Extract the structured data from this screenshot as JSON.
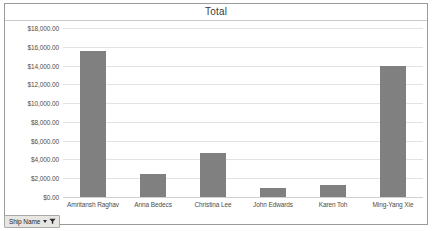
{
  "chart_data": {
    "type": "bar",
    "title": "Total",
    "xlabel": "",
    "ylabel": "",
    "categories": [
      "Amritansh Raghav",
      "Anna Bedecs",
      "Christina Lee",
      "John Edwards",
      "Karen Toh",
      "Ming-Yang Xie"
    ],
    "values": [
      15500,
      2500,
      4700,
      1000,
      1300,
      13900
    ],
    "ylim": [
      0,
      18000
    ],
    "ytick_values": [
      0,
      2000,
      4000,
      6000,
      8000,
      10000,
      12000,
      14000,
      16000,
      18000
    ],
    "ytick_labels": [
      "$0.00",
      "$2,000.00",
      "$4,000.00",
      "$6,000.00",
      "$8,000.00",
      "$10,000.00",
      "$12,000.00",
      "$14,000.00",
      "$16,000.00",
      "$18,000.00"
    ],
    "grid": true,
    "legend": false,
    "series": [
      {
        "name": "Total",
        "color": "#808080",
        "values": [
          15500,
          2500,
          4700,
          1000,
          1300,
          13900
        ]
      }
    ]
  },
  "filter_button": {
    "label": "Ship Name",
    "dropdown_icon": "chevron-down-icon",
    "filter_icon": "funnel-icon"
  }
}
